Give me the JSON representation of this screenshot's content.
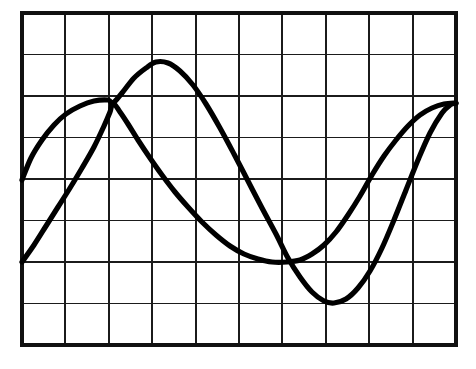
{
  "figure": {
    "background_color": "#ffffff",
    "line_color": "#000000",
    "grid_color": "#1b1b1b",
    "border_color": "#111111"
  },
  "chart_data": {
    "type": "line",
    "title": "",
    "subtitle": "",
    "xlabel": "",
    "ylabel": "",
    "grid": true,
    "legend": "none",
    "annotations": [],
    "plot_box_px": {
      "left": 22,
      "top": 13,
      "right": 456,
      "bottom": 345
    },
    "grid_divisions": {
      "x": 10,
      "y": 8
    },
    "x_tick_labels": [],
    "y_tick_labels": [],
    "xlim": [
      0,
      10
    ],
    "ylim": [
      -4,
      4
    ],
    "axis_units": "divisions",
    "x_gridlines_px": [
      22,
      65.4,
      108.8,
      152.2,
      195.6,
      239,
      282.4,
      325.8,
      369.2,
      412.6,
      456
    ],
    "y_gridlines_px": [
      13,
      54.5,
      96,
      137.5,
      179,
      220.5,
      262,
      303.5,
      345
    ],
    "series": [
      {
        "name": "waveform-a",
        "description": "full-cycle sine, peak at 3.1 divisions, trough at 7.2 divisions",
        "amplitude_div": 2.0,
        "period_div": 8.3,
        "phase_start_div": 1.1,
        "points_px": [
          [
            22,
            180
          ],
          [
            31,
            158
          ],
          [
            42,
            140
          ],
          [
            54,
            125
          ],
          [
            66,
            114
          ],
          [
            80,
            106
          ],
          [
            94,
            101
          ],
          [
            108,
            100
          ],
          [
            113,
            103
          ],
          [
            122,
            93
          ],
          [
            134,
            78
          ],
          [
            146,
            68
          ],
          [
            156,
            62
          ],
          [
            168,
            63
          ],
          [
            180,
            71
          ],
          [
            193,
            85
          ],
          [
            206,
            104
          ],
          [
            220,
            128
          ],
          [
            234,
            154
          ],
          [
            248,
            181
          ],
          [
            262,
            208
          ],
          [
            276,
            234
          ],
          [
            288,
            258
          ],
          [
            300,
            277
          ],
          [
            312,
            292
          ],
          [
            324,
            301
          ],
          [
            334,
            303
          ],
          [
            346,
            299
          ],
          [
            358,
            288
          ],
          [
            370,
            271
          ],
          [
            382,
            248
          ],
          [
            394,
            220
          ],
          [
            406,
            190
          ],
          [
            418,
            160
          ],
          [
            430,
            133
          ],
          [
            442,
            113
          ],
          [
            450,
            105
          ],
          [
            456,
            103
          ]
        ]
      },
      {
        "name": "waveform-b",
        "description": "phase-lagged sine, rises from lower-left, crosses at 2.1 div, trough at 7.1 divisions",
        "amplitude_div": 2.0,
        "period_div": 9.4,
        "phase_start_div": 0.0,
        "points_px": [
          [
            22,
            262
          ],
          [
            34,
            245
          ],
          [
            46,
            226
          ],
          [
            58,
            207
          ],
          [
            70,
            188
          ],
          [
            82,
            168
          ],
          [
            94,
            147
          ],
          [
            104,
            126
          ],
          [
            110,
            112
          ],
          [
            113,
            103
          ],
          [
            120,
            112
          ],
          [
            128,
            124
          ],
          [
            138,
            140
          ],
          [
            150,
            158
          ],
          [
            162,
            175
          ],
          [
            175,
            192
          ],
          [
            188,
            207
          ],
          [
            202,
            222
          ],
          [
            216,
            235
          ],
          [
            230,
            246
          ],
          [
            244,
            254
          ],
          [
            258,
            259
          ],
          [
            272,
            262
          ],
          [
            287,
            262
          ],
          [
            300,
            260
          ],
          [
            312,
            254
          ],
          [
            324,
            245
          ],
          [
            336,
            232
          ],
          [
            348,
            215
          ],
          [
            360,
            196
          ],
          [
            372,
            175
          ],
          [
            384,
            156
          ],
          [
            396,
            140
          ],
          [
            408,
            126
          ],
          [
            420,
            115
          ],
          [
            432,
            108
          ],
          [
            444,
            104
          ],
          [
            456,
            103
          ]
        ]
      }
    ]
  }
}
